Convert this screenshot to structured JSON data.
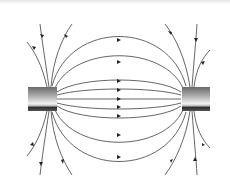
{
  "figure": {
    "colors": {
      "line": "#555555",
      "arrow": "#222222",
      "magnet_light": "#f0f0f0",
      "magnet_dark": "#3a3a3a"
    },
    "magnets": [
      {
        "name": "left-magnet",
        "x": 28,
        "y": 87,
        "w": 29,
        "h": 24
      },
      {
        "name": "right-magnet",
        "x": 182,
        "y": 87,
        "w": 28,
        "h": 24
      }
    ],
    "center_arrow_x": 119,
    "inner_lines_y": [
      40,
      62,
      81,
      90,
      99,
      107,
      116,
      135,
      157
    ]
  }
}
